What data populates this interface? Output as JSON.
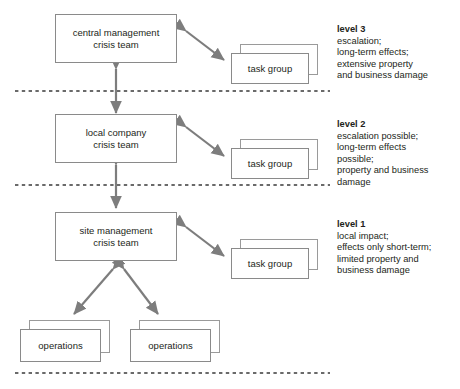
{
  "diagram": {
    "colors": {
      "box_border": "#8a8a8a",
      "arrow": "#7d7d7d",
      "divider": "#3a3a3a",
      "text": "#231f20",
      "background": "#ffffff"
    },
    "nodes": {
      "central": {
        "line1": "central management",
        "line2": "crisis team"
      },
      "local": {
        "line1": "local company",
        "line2": "crisis team"
      },
      "site": {
        "line1": "site management",
        "line2": "crisis team"
      },
      "task_group_label": "task group",
      "operations_label": "operations"
    },
    "levels": [
      {
        "id": "level-3",
        "title": "level 3",
        "lines": [
          "escalation;",
          "long-term effects;",
          "extensive property",
          "and business damage"
        ]
      },
      {
        "id": "level-2",
        "title": "level 2",
        "lines": [
          "escalation possible;",
          "long-term effects",
          "possible;",
          "property and business",
          "damage"
        ]
      },
      {
        "id": "level-1",
        "title": "level 1",
        "lines": [
          "local impact;",
          "effects only short-term;",
          "limited property and",
          "business damage"
        ]
      }
    ]
  }
}
